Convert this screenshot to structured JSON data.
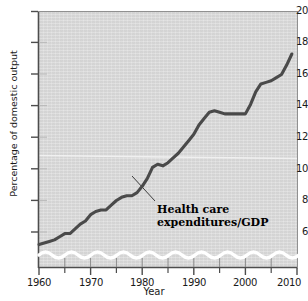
{
  "chart_data": {
    "type": "line",
    "title": "",
    "xlabel": "Year",
    "ylabel": "Percentage of domestic output",
    "xlim": [
      1960,
      2010
    ],
    "ylim": [
      5,
      20
    ],
    "y_axis_break": true,
    "grid": false,
    "legend_position": "inline-annotation",
    "annotations": [
      {
        "text_line1": "Health care",
        "text_line2": "expenditures/GDP",
        "points_to_x": 1980,
        "points_to_y": 8.6
      }
    ],
    "xticks": [
      1960,
      1970,
      1980,
      1990,
      2000,
      2010
    ],
    "xticklabels": [
      "1960",
      "1970",
      "1980",
      "1990",
      "2000",
      "2010"
    ],
    "xminorticks": [
      1965,
      1975,
      1985,
      1995,
      2005
    ],
    "yticks": [
      6,
      8,
      10,
      12,
      14,
      16,
      18,
      20
    ],
    "yticklabels": [
      "6",
      "8",
      "10",
      "12",
      "14",
      "16",
      "18",
      "20"
    ],
    "series": [
      {
        "name": "Health care expenditures/GDP",
        "color": "#4a4a4a",
        "x": [
          1960,
          1961,
          1962,
          1963,
          1964,
          1965,
          1966,
          1967,
          1968,
          1969,
          1970,
          1971,
          1972,
          1973,
          1974,
          1975,
          1976,
          1977,
          1978,
          1979,
          1980,
          1981,
          1982,
          1983,
          1984,
          1985,
          1986,
          1987,
          1988,
          1989,
          1990,
          1991,
          1992,
          1993,
          1994,
          1995,
          1996,
          1997,
          1998,
          1999,
          2000,
          2001,
          2002,
          2003,
          2004,
          2005,
          2006,
          2007,
          2008,
          2009
        ],
        "values": [
          5.2,
          5.3,
          5.4,
          5.5,
          5.7,
          5.9,
          5.9,
          6.2,
          6.5,
          6.7,
          7.1,
          7.3,
          7.4,
          7.4,
          7.7,
          8.0,
          8.2,
          8.3,
          8.3,
          8.5,
          8.9,
          9.4,
          10.1,
          10.3,
          10.2,
          10.4,
          10.7,
          11.0,
          11.4,
          11.8,
          12.2,
          12.8,
          13.2,
          13.6,
          13.7,
          13.6,
          13.5,
          13.5,
          13.5,
          13.5,
          13.5,
          14.1,
          14.9,
          15.4,
          15.5,
          15.6,
          15.8,
          16.0,
          16.6,
          17.3
        ]
      }
    ]
  },
  "chart": {
    "y_axis_title": "Percentage of domestic output",
    "x_axis_title": "Year",
    "annotation_line1": "Health care",
    "annotation_line2": "expenditures/GDP",
    "y_tick_20": "20",
    "y_tick_18": "18",
    "y_tick_16": "16",
    "y_tick_14": "14",
    "y_tick_12": "12",
    "y_tick_10": "10",
    "y_tick_8": "8",
    "y_tick_6": "6",
    "x_tick_1960": "1960",
    "x_tick_1970": "1970",
    "x_tick_1980": "1980",
    "x_tick_1990": "1990",
    "x_tick_2000": "2000",
    "x_tick_2010": "2010",
    "colors": {
      "plot_background": "#d9d9d9",
      "series_line": "#4a4a4a",
      "axis": "#4d4d4d",
      "break_line": "#ffffff"
    }
  }
}
